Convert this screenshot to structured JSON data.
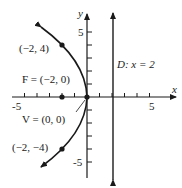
{
  "figure": {
    "type": "parabola-graph",
    "equation_hint": "y^2 = -8x",
    "axes": {
      "x_label": "x",
      "y_label": "y",
      "x_tick_labels": [
        "-5",
        "5"
      ],
      "y_tick_labels": [
        "5",
        "-5"
      ],
      "x_range": [
        -6,
        7
      ],
      "y_range": [
        -6.5,
        6.5
      ]
    },
    "points": [
      {
        "name": "upper-point",
        "label": "(−2, 4)",
        "x": -2,
        "y": 4
      },
      {
        "name": "focus",
        "label": "F = (−2, 0)",
        "x": -2,
        "y": 0
      },
      {
        "name": "vertex",
        "label": "V = (0, 0)",
        "x": 0,
        "y": 0
      },
      {
        "name": "lower-point",
        "label": "(−2, −4)",
        "x": -2,
        "y": -4
      }
    ],
    "directrix": {
      "label": "D: x = 2",
      "x": 2
    },
    "colors": {
      "ink": "#1a1a1a",
      "background": "#ffffff"
    }
  }
}
